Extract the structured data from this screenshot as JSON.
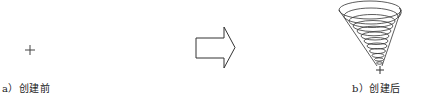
{
  "figure": {
    "panel_a": {
      "label": "a）创建前",
      "content": "crosshair-icon"
    },
    "transition": {
      "content": "right-arrow-icon"
    },
    "panel_b": {
      "label": "b）创建后",
      "content": "conical-helix"
    }
  },
  "colors": {
    "stroke": "#333333",
    "background": "#ffffff"
  }
}
